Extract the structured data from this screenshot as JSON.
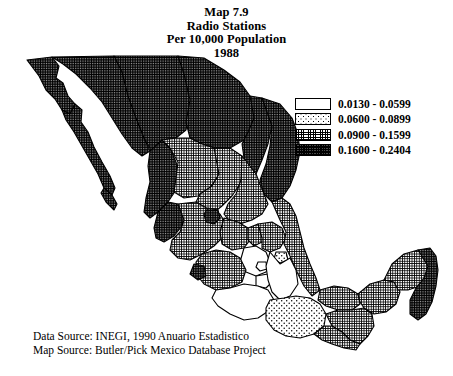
{
  "title": {
    "line1": "Map 7.9",
    "line2": "Radio Stations",
    "line3": "Per 10,000 Population",
    "line4": "1988"
  },
  "legend": {
    "classes": [
      {
        "id": "c0",
        "label": "0.0130 - 0.0599",
        "pattern": "solid-white",
        "low": 0.013,
        "high": 0.0599
      },
      {
        "id": "c1",
        "label": "0.0600 - 0.0899",
        "pattern": "sparse-dots",
        "low": 0.06,
        "high": 0.0899
      },
      {
        "id": "c2",
        "label": "0.0900 - 0.1599",
        "pattern": "fine-grid",
        "low": 0.09,
        "high": 0.1599
      },
      {
        "id": "c3",
        "label": "0.1600 - 0.2404",
        "pattern": "dense-stipple",
        "low": 0.16,
        "high": 0.2404
      }
    ]
  },
  "map": {
    "variable": "Radio stations per 10,000 population",
    "year": "1988",
    "country": "Mexico",
    "unit_type": "state",
    "regions": [
      {
        "name": "baja-california",
        "class": "c3"
      },
      {
        "name": "baja-california-sur",
        "class": "c3"
      },
      {
        "name": "sonora",
        "class": "c3"
      },
      {
        "name": "chihuahua",
        "class": "c3"
      },
      {
        "name": "coahuila",
        "class": "c3"
      },
      {
        "name": "nuevo-leon",
        "class": "c3"
      },
      {
        "name": "tamaulipas",
        "class": "c3"
      },
      {
        "name": "sinaloa",
        "class": "c3"
      },
      {
        "name": "durango",
        "class": "c2"
      },
      {
        "name": "zacatecas",
        "class": "c2"
      },
      {
        "name": "san-luis-potosi",
        "class": "c2"
      },
      {
        "name": "nayarit",
        "class": "c3"
      },
      {
        "name": "jalisco",
        "class": "c2"
      },
      {
        "name": "aguascalientes",
        "class": "c3"
      },
      {
        "name": "guanajuato",
        "class": "c2"
      },
      {
        "name": "queretaro",
        "class": "c2"
      },
      {
        "name": "hidalgo",
        "class": "c2"
      },
      {
        "name": "colima",
        "class": "c3"
      },
      {
        "name": "michoacan",
        "class": "c2"
      },
      {
        "name": "mexico-state",
        "class": "c0"
      },
      {
        "name": "distrito-federal",
        "class": "c0"
      },
      {
        "name": "morelos",
        "class": "c0"
      },
      {
        "name": "tlaxcala",
        "class": "c1"
      },
      {
        "name": "puebla",
        "class": "c0"
      },
      {
        "name": "veracruz",
        "class": "c2"
      },
      {
        "name": "guerrero",
        "class": "c0"
      },
      {
        "name": "oaxaca",
        "class": "c1"
      },
      {
        "name": "chiapas",
        "class": "c2"
      },
      {
        "name": "tabasco",
        "class": "c2"
      },
      {
        "name": "campeche",
        "class": "c2"
      },
      {
        "name": "yucatan",
        "class": "c2"
      },
      {
        "name": "quintana-roo",
        "class": "c3"
      }
    ]
  },
  "sources": {
    "data_source": "Data Source: INEGI, 1990 Anuario Estadistico",
    "map_source": "Map Source: Butler/Pick Mexico Database Project"
  },
  "colors": {
    "ink": "#000000",
    "paper": "#ffffff",
    "dense_fill": "#4a4a4a"
  }
}
